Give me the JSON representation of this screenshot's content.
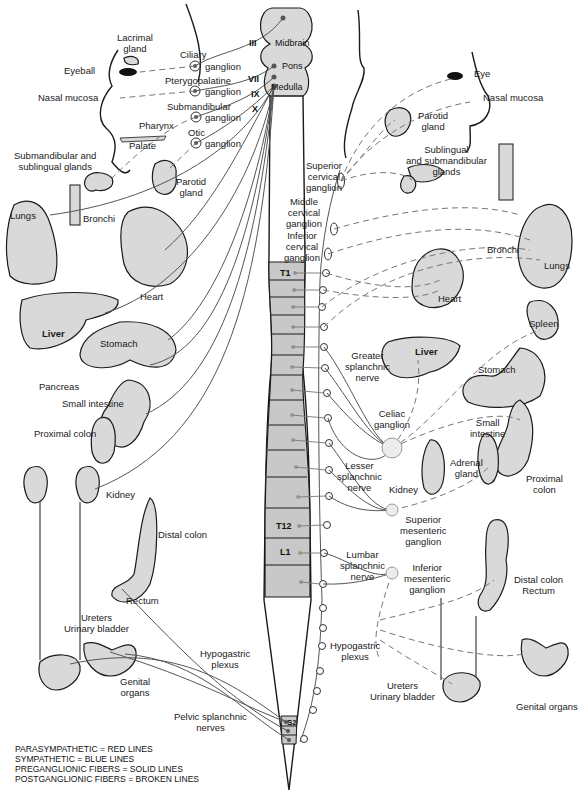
{
  "legend": [
    "PARASYMPATHETIC = RED LINES",
    "SYMPATHETIC = BLUE LINES",
    "PREGANGLIONIC FIBERS = SOLID LINES",
    "POSTGANGLIONIC FIBERS = BROKEN LINES"
  ],
  "brainstem": {
    "regions": [
      "Midbrain",
      "Pons",
      "Medulla"
    ],
    "cranial_nerves": [
      "III",
      "VII",
      "IX",
      "X"
    ]
  },
  "spinal_segments": {
    "T1": "T1",
    "T12": "T12",
    "L1": "L1",
    "S2": "S2"
  },
  "parasympathetic_side": {
    "lacrimal_gland": "Lacrimal\ngland",
    "eyeball": "Eyeball",
    "nasal_mucosa": "Nasal mucosa",
    "ciliary_ganglion_a": "Ciliary",
    "ciliary_ganglion_b": "ganglion",
    "pterygopalatine_a": "Pterygopalatine",
    "pterygopalatine_b": "ganglion",
    "submandibular_a": "Submandibular",
    "submandibular_b": "ganglion",
    "pharynx": "Pharynx",
    "otic_a": "Otic",
    "otic_b": "ganglion",
    "palate": "Palate",
    "subm_subl_glands": "Submandibular and\nsublingual glands",
    "parotid_gland": "Parotid\ngland",
    "lungs": "Lungs",
    "bronchi": "Bronchi",
    "heart": "Heart",
    "liver": "Liver",
    "stomach": "Stomach",
    "pancreas": "Pancreas",
    "small_intestine": "Small intestine",
    "proximal_colon": "Proximal colon",
    "kidney": "Kidney",
    "distal_colon": "Distal colon",
    "rectum": "Rectum",
    "ureters_bladder": "Ureters\nUrinary bladder",
    "hypogastric_plexus": "Hypogastric\nplexus",
    "genital_organs": "Genital\norgans",
    "pelvic_splanchnic": "Pelvic splanchnic\nnerves"
  },
  "sympathetic_side": {
    "eye": "Eye",
    "nasal_mucosa": "Nasal mucosa",
    "parotid_gland": "Parotid\ngland",
    "subl_subm_glands": "Sublingual\nand submandibular\nglands",
    "superior_cervical_ganglion": "Superior\ncervical\nganglion",
    "middle_cervical_ganglion": "Middle\ncervical\nganglion",
    "inferior_cervical_ganglion": "Inferior\ncervical\nganglion",
    "heart": "Heart",
    "bronchi": "Bronchi",
    "lungs": "Lungs",
    "spleen": "Spleen",
    "liver": "Liver",
    "stomach": "Stomach",
    "greater_splanchnic": "Greater\nsplanchnic\nnerve",
    "celiac_ganglion": "Celiac\nganglion",
    "small_intestine": "Small\nintestine",
    "adrenal_gland": "Adrenal\ngland",
    "proximal_colon": "Proximal\ncolon",
    "lesser_splanchnic": "Lesser\nsplanchnic\nnerve",
    "kidney": "Kidney",
    "superior_mesenteric_ganglion": "Superior\nmesenteric\nganglion",
    "lumbar_splanchnic": "Lumbar\nsplanchnic\nnerve",
    "inferior_mesenteric_ganglion": "Inferior\nmesenteric\nganglion",
    "distal_colon_rectum": "Distal colon\nRectum",
    "hypogastric_plexus": "Hypogastric\nplexus",
    "ureters_bladder": "Ureters\nUrinary bladder",
    "genital_organs": "Genital organs"
  },
  "colors": {
    "organ_fill": "#d9d9d9",
    "cord_fill": "#c8c8c8",
    "outline": "#1a1a1a",
    "nerve_line": "#555555",
    "background": "#ffffff"
  }
}
